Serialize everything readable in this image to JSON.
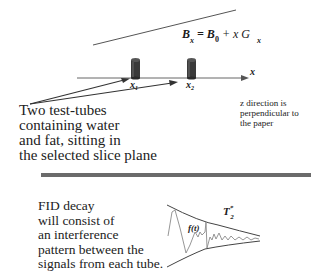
{
  "equation": {
    "lhs": "B",
    "lhs_sub": "x",
    "equals": "=",
    "b0": "B",
    "b0_sub": "0",
    "plus_term": "+ x G",
    "g_sub": "x"
  },
  "axis": {
    "label": "x"
  },
  "tubes": [
    {
      "label": "x",
      "sub": "1"
    },
    {
      "label": "x",
      "sub": "2"
    }
  ],
  "tubes_caption": {
    "lines": [
      "Two test-tubes",
      "containing water",
      "and fat, sitting in",
      "the selected slice plane"
    ]
  },
  "z_note": {
    "lines": [
      "z direction is",
      "perpendicular to",
      "the paper"
    ]
  },
  "fid": {
    "lines": [
      "FID decay",
      "will consist of",
      "an interference",
      "pattern between the",
      "signals from each tube."
    ],
    "curve_label": "f(t)",
    "t2_label": "T",
    "t2_sup": "*",
    "t2_sub": "2"
  },
  "colors": {
    "tube": "#3a3a3a",
    "divider": "#6b6b6b",
    "line": "#555555",
    "signal": "#8a8a8a"
  }
}
